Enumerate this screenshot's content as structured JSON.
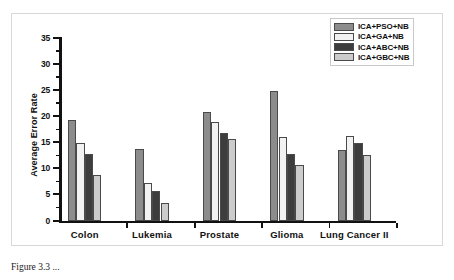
{
  "chart_data": {
    "type": "bar",
    "title": "",
    "xlabel": "",
    "ylabel": "Average Error Rate",
    "ylim": [
      0,
      35
    ],
    "ytick_step": 5,
    "minor_ticks": true,
    "grid": false,
    "legend_position": "top-right",
    "categories": [
      "Colon",
      "Lukemia",
      "Prostate",
      "Glioma",
      "Lung Cancer II"
    ],
    "ytick_labels": [
      "0",
      "5",
      "10",
      "15",
      "20",
      "25",
      "30",
      "35"
    ],
    "series": [
      {
        "name": "ICA+PSO+NB",
        "color": "#8c8c8c",
        "values": [
          19.2,
          13.8,
          20.8,
          24.8,
          13.5
        ]
      },
      {
        "name": "ICA+GA+NB",
        "color": "#f2f2f2",
        "values": [
          14.9,
          7.2,
          18.9,
          16.0,
          16.2
        ]
      },
      {
        "name": "ICA+ABC+NB",
        "color": "#3d3d3d",
        "values": [
          12.7,
          5.6,
          16.8,
          12.7,
          14.8
        ]
      },
      {
        "name": "ICA+GBC+NB",
        "color": "#cccccc",
        "values": [
          8.8,
          3.4,
          15.6,
          10.6,
          12.5
        ]
      }
    ]
  },
  "legend": {
    "items": [
      {
        "label": "ICA+PSO+NB",
        "color": "#8c8c8c"
      },
      {
        "label": "ICA+GA+NB",
        "color": "#f2f2f2"
      },
      {
        "label": "ICA+ABC+NB",
        "color": "#3d3d3d"
      },
      {
        "label": "ICA+GBC+NB",
        "color": "#cccccc"
      }
    ]
  },
  "caption": {
    "text": "Figure 3.3  ..."
  }
}
